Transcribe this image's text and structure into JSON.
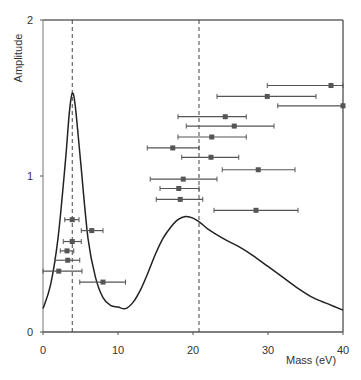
{
  "chart_data": {
    "type": "scatter",
    "title": "",
    "xlabel": "Mass (eV)",
    "ylabel": "Amplitude",
    "xlim": [
      0,
      40
    ],
    "ylim": [
      0,
      2
    ],
    "xticks": [
      0,
      10,
      20,
      30,
      40
    ],
    "yticks": [
      0,
      1,
      2
    ],
    "xtick_labels": [
      "0",
      "10",
      "20",
      "30",
      "40"
    ],
    "ytick_labels": [
      "0",
      "1",
      "2"
    ],
    "grid": false,
    "legend": null,
    "vertical_dashed_lines": [
      3.9,
      20.8
    ],
    "curve": {
      "name": "amplitude-curve",
      "x": [
        0,
        1,
        2,
        3,
        3.5,
        3.9,
        4.3,
        5,
        6,
        7,
        8,
        9,
        10,
        11,
        12,
        13,
        14,
        15,
        16,
        17,
        18,
        19,
        20,
        21,
        22,
        24,
        26,
        28,
        30,
        32,
        34,
        36,
        38,
        40
      ],
      "y": [
        0.15,
        0.3,
        0.6,
        1.1,
        1.4,
        1.53,
        1.45,
        1.1,
        0.6,
        0.35,
        0.22,
        0.17,
        0.16,
        0.15,
        0.19,
        0.27,
        0.38,
        0.5,
        0.6,
        0.67,
        0.72,
        0.74,
        0.73,
        0.7,
        0.66,
        0.6,
        0.55,
        0.49,
        0.42,
        0.35,
        0.28,
        0.22,
        0.18,
        0.14
      ]
    },
    "points": [
      {
        "x": 38.4,
        "y": 1.58,
        "xmin": 29.9,
        "xmax": 40.0
      },
      {
        "x": 29.9,
        "y": 1.51,
        "xmin": 23.2,
        "xmax": 36.4
      },
      {
        "x": 40.0,
        "y": 1.45,
        "xmin": 31.3,
        "xmax": 40.0
      },
      {
        "x": 24.3,
        "y": 1.38,
        "xmin": 18.0,
        "xmax": 27.1
      },
      {
        "x": 25.5,
        "y": 1.32,
        "xmin": 19.1,
        "xmax": 30.8
      },
      {
        "x": 22.5,
        "y": 1.25,
        "xmin": 18.0,
        "xmax": 27.1
      },
      {
        "x": 17.3,
        "y": 1.18,
        "xmin": 13.9,
        "xmax": 20.8
      },
      {
        "x": 22.4,
        "y": 1.12,
        "xmin": 18.5,
        "xmax": 26.1
      },
      {
        "x": 28.7,
        "y": 1.04,
        "xmin": 23.9,
        "xmax": 33.6
      },
      {
        "x": 18.7,
        "y": 0.98,
        "xmin": 14.3,
        "xmax": 23.2
      },
      {
        "x": 18.1,
        "y": 0.92,
        "xmin": 15.6,
        "xmax": 20.8
      },
      {
        "x": 18.3,
        "y": 0.85,
        "xmin": 15.1,
        "xmax": 21.3
      },
      {
        "x": 28.4,
        "y": 0.78,
        "xmin": 22.8,
        "xmax": 34.0
      },
      {
        "x": 3.9,
        "y": 0.72,
        "xmin": 2.9,
        "xmax": 4.8
      },
      {
        "x": 6.5,
        "y": 0.65,
        "xmin": 5.1,
        "xmax": 8.0
      },
      {
        "x": 3.9,
        "y": 0.58,
        "xmin": 2.7,
        "xmax": 5.1
      },
      {
        "x": 3.2,
        "y": 0.52,
        "xmin": 2.3,
        "xmax": 4.1
      },
      {
        "x": 3.3,
        "y": 0.46,
        "xmin": 1.6,
        "xmax": 4.9
      },
      {
        "x": 2.1,
        "y": 0.39,
        "xmin": 0.0,
        "xmax": 5.2
      },
      {
        "x": 8.0,
        "y": 0.32,
        "xmin": 4.9,
        "xmax": 11.0
      }
    ]
  }
}
